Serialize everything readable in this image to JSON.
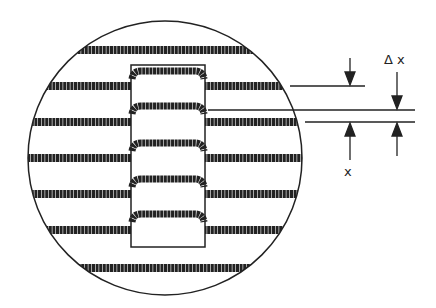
{
  "figure": {
    "labels": {
      "delta_x": "Δ x",
      "x": "x"
    },
    "colors": {
      "ink": "#222222",
      "background": "#ffffff"
    },
    "circle": {
      "cx": 165,
      "cy": 158,
      "r": 137
    },
    "window": {
      "x": 131,
      "y": 65,
      "w": 74,
      "h": 182
    },
    "outer_fringes_y": [
      50,
      86,
      122,
      158,
      194,
      230,
      268
    ],
    "inner_fringes_y": [
      71,
      106,
      143,
      179,
      214
    ],
    "reference_lines": [
      {
        "y": 86,
        "x1": 290,
        "x2": 365
      },
      {
        "y": 110,
        "x1": 208,
        "x2": 415
      },
      {
        "y": 122,
        "x1": 305,
        "x2": 415
      }
    ]
  }
}
